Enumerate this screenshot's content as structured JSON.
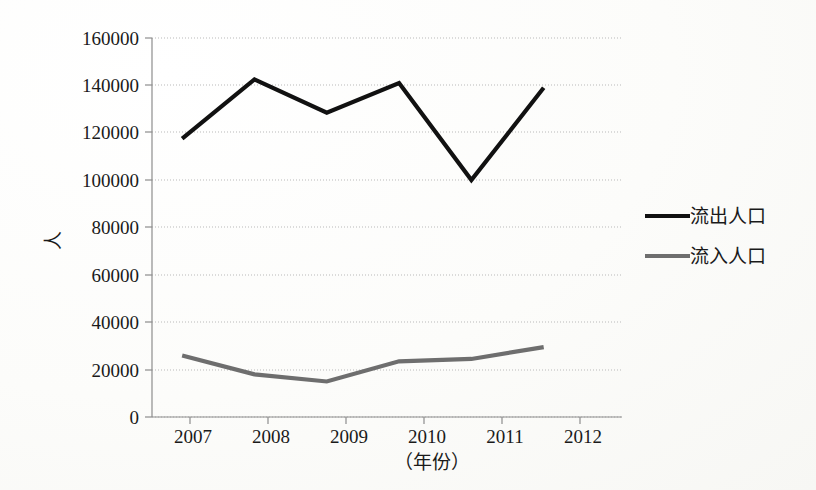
{
  "chart_data": {
    "type": "line",
    "title": "",
    "xlabel": "（年份）",
    "ylabel": "人",
    "categories": [
      "2007",
      "2008",
      "2009",
      "2010",
      "2011",
      "2012"
    ],
    "x": [
      2007,
      2008,
      2009,
      2010,
      2011,
      2012
    ],
    "ylim": [
      0,
      160000
    ],
    "yticks": [
      0,
      20000,
      40000,
      60000,
      80000,
      100000,
      120000,
      140000,
      160000
    ],
    "ytick_labels": [
      "0",
      "20000",
      "40000",
      "60000",
      "80000",
      "100000",
      "120000",
      "140000",
      "160000"
    ],
    "grid": true,
    "grid_axis": "y",
    "legend_position": "right",
    "series": [
      {
        "name": "流出人口",
        "color": "#111111",
        "values": [
          117500,
          142500,
          128500,
          141000,
          100000,
          139000
        ]
      },
      {
        "name": "流入人口",
        "color": "#6e6e6e",
        "values": [
          26000,
          18000,
          15000,
          23500,
          24500,
          29500
        ]
      }
    ]
  },
  "axes": {
    "y_axis_title": "人",
    "x_axis_title": "（年份）"
  },
  "legend": {
    "items": [
      {
        "label": "流出人口",
        "color": "#111111"
      },
      {
        "label": "流入人口",
        "color": "#6e6e6e"
      }
    ]
  },
  "colors": {
    "outflow": "#111111",
    "inflow": "#6e6e6e",
    "gridline": "#b9b9b9",
    "axis": "#8d8d8d",
    "text": "#1a1a1a",
    "background": "#fdfdfb"
  }
}
